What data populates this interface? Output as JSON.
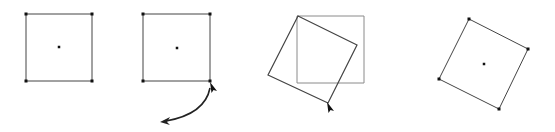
{
  "diagram": {
    "colors": {
      "background": "#ffffff",
      "outline": "#444444",
      "ghost_outline": "#8a8a8a",
      "handle": "#111111",
      "cursor": "#111111",
      "arrow": "#222222"
    },
    "steps": [
      {
        "id": "step-1-selected-square",
        "description": "Square selected with corner handles and center point",
        "square": [
          [
            26,
            14
          ],
          [
            92,
            14
          ],
          [
            92,
            81
          ],
          [
            26,
            81
          ]
        ],
        "center": [
          59,
          47
        ],
        "handles": [
          [
            26,
            14
          ],
          [
            92,
            14
          ],
          [
            92,
            81
          ],
          [
            26,
            81
          ]
        ]
      },
      {
        "id": "step-2-grab-corner",
        "description": "Cursor grabs bottom-right corner; curved arrow shows rotation direction",
        "square": [
          [
            143,
            14
          ],
          [
            210,
            14
          ],
          [
            210,
            81
          ],
          [
            143,
            81
          ]
        ],
        "center": [
          177,
          48
        ],
        "handles": [
          [
            143,
            14
          ],
          [
            210,
            14
          ],
          [
            210,
            81
          ],
          [
            143,
            81
          ]
        ],
        "cursor_tip": [
          210,
          82
        ],
        "rotation_arrow": {
          "start": [
            210,
            88
          ],
          "control": [
            205,
            114
          ],
          "end": [
            160,
            122
          ]
        }
      },
      {
        "id": "step-3-dragging",
        "description": "Rotated outline follows cursor over original ghost square",
        "ghost_square": [
          [
            297,
            16
          ],
          [
            364,
            16
          ],
          [
            364,
            83
          ],
          [
            297,
            83
          ]
        ],
        "rotated_square": [
          [
            298,
            16
          ],
          [
            357,
            45
          ],
          [
            328,
            103
          ],
          [
            268,
            75
          ]
        ],
        "cursor_tip": [
          327,
          102
        ]
      },
      {
        "id": "step-4-rotated-result",
        "description": "Square rotated with handles and center point",
        "square": [
          [
            469,
            19
          ],
          [
            528,
            49
          ],
          [
            499,
            109
          ],
          [
            439,
            79
          ]
        ],
        "center": [
          484,
          64
        ],
        "handles": [
          [
            469,
            19
          ],
          [
            528,
            49
          ],
          [
            499,
            109
          ],
          [
            439,
            79
          ]
        ]
      }
    ]
  }
}
